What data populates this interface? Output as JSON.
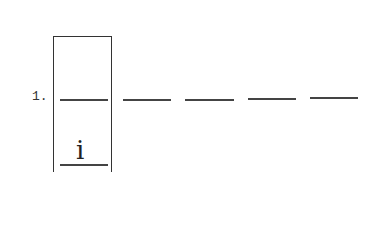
{
  "item": {
    "number": "1.",
    "answer_glyph": "i",
    "blank_count": 4
  }
}
